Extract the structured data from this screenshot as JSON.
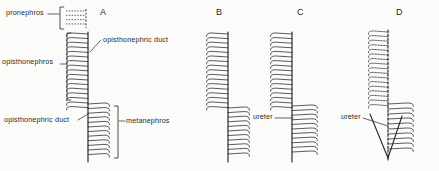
{
  "figure": {
    "background_color": "#fbfbf9",
    "ink_color": "#262626"
  },
  "panels": [
    {
      "letter": "A",
      "letter_x": 100,
      "letter_y": 8,
      "duct_x": 88,
      "duct_top": 32,
      "duct_bottom": 162,
      "tubule_side": "left",
      "tubule_count": 17,
      "tubule_top": 34,
      "tubule_spacing": 4.6,
      "tubule_length": 22,
      "pronephros": {
        "x": 86,
        "top": 9,
        "bottom": 28,
        "count": 4,
        "dashed": true,
        "length": 20
      },
      "metanephros": {
        "duct_x": 88,
        "top": 104,
        "count": 12,
        "spacing": 4.6,
        "length": 22,
        "side": "right"
      }
    },
    {
      "letter": "B",
      "letter_x": 216,
      "letter_y": 8,
      "duct_x": 228,
      "duct_top": 32,
      "duct_bottom": 162,
      "tubule_side": "left",
      "tubule_count": 17,
      "tubule_top": 34,
      "tubule_spacing": 4.6,
      "tubule_length": 22,
      "metanephros": {
        "duct_x": 228,
        "top": 108,
        "count": 11,
        "spacing": 4.6,
        "length": 22,
        "side": "right"
      }
    },
    {
      "letter": "C",
      "letter_x": 297,
      "letter_y": 8,
      "duct_x": 292,
      "duct_top": 32,
      "duct_bottom": 162,
      "tubule_side": "left",
      "tubule_count": 17,
      "tubule_top": 34,
      "tubule_spacing": 4.6,
      "tubule_length": 22,
      "metanephros": {
        "duct_x": 292,
        "top": 106,
        "count": 11,
        "spacing": 4.6,
        "length": 26,
        "side": "right"
      }
    },
    {
      "letter": "D",
      "letter_x": 396,
      "letter_y": 8,
      "duct_x": 388,
      "duct_top": 30,
      "duct_bottom": 160,
      "duct_dashed": true,
      "tubule_side": "left",
      "tubule_count": 17,
      "tubule_top": 32,
      "tubule_spacing": 4.6,
      "tubule_length": 20,
      "tubules_dashed": true,
      "metanephros": {
        "duct_x": 388,
        "top": 104,
        "count": 10,
        "spacing": 5.0,
        "length": 26,
        "side": "right"
      }
    }
  ],
  "labels": [
    {
      "name": "pronephros",
      "text": "pronephros",
      "x": 6,
      "y": 13,
      "align": "left"
    },
    {
      "name": "opisthonephros",
      "text": "opisthonephros",
      "x": 2,
      "y": 62,
      "align": "left"
    },
    {
      "name": "opisthonephric-duct-top",
      "text": "opisthonephric duct",
      "x": 103,
      "y": 40,
      "align": "left"
    },
    {
      "name": "opisthonephric-duct-bottom",
      "text": "opisthonephric duct",
      "x": 4,
      "y": 120,
      "align": "left"
    },
    {
      "name": "metanephros",
      "text": "metanephros",
      "x": 126,
      "y": 121,
      "align": "left"
    },
    {
      "name": "ureter-c",
      "text": "ureter",
      "x": 253,
      "y": 117,
      "align": "left"
    },
    {
      "name": "ureter-d",
      "text": "ureter",
      "x": 341,
      "y": 117,
      "align": "left"
    }
  ],
  "brackets": [
    {
      "name": "pronephros-bracket",
      "x": 60,
      "top": 7,
      "bottom": 29,
      "facing": "right"
    },
    {
      "name": "opisthonephros-bracket",
      "x": 67,
      "top": 33,
      "bottom": 100,
      "facing": "right"
    },
    {
      "name": "metanephros-bracket",
      "x": 118,
      "top": 106,
      "bottom": 158,
      "facing": "left"
    }
  ],
  "leaders": [
    {
      "name": "pronephros-leader",
      "x1": 48,
      "y1": 14,
      "x2": 59,
      "y2": 14
    },
    {
      "name": "opisthonephros-leader",
      "x1": 60,
      "y1": 64,
      "x2": 66,
      "y2": 64
    },
    {
      "name": "opisthonephric-duct-top-leader",
      "x1": 101,
      "y1": 40,
      "x2": 90,
      "y2": 52
    },
    {
      "name": "opisthonephric-duct-bottom-leader",
      "x1": 78,
      "y1": 120,
      "x2": 88,
      "y2": 114
    },
    {
      "name": "metanephros-leader",
      "x1": 119,
      "y1": 121,
      "x2": 125,
      "y2": 121
    },
    {
      "name": "ureter-c-leader",
      "x1": 275,
      "y1": 118,
      "x2": 293,
      "y2": 118
    },
    {
      "name": "ureter-d-leader",
      "x1": 363,
      "y1": 118,
      "x2": 388,
      "y2": 126
    }
  ]
}
